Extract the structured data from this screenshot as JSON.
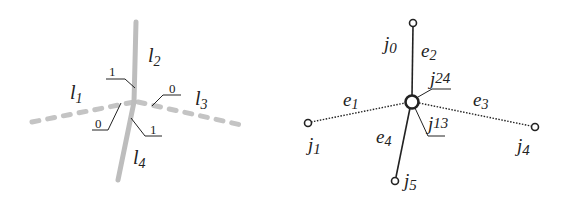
{
  "left_diagram": {
    "lines": [
      {
        "id": "l1",
        "label": "l",
        "sub": "1",
        "style": "dashed"
      },
      {
        "id": "l2",
        "label": "l",
        "sub": "2",
        "style": "solid"
      },
      {
        "id": "l3",
        "label": "l",
        "sub": "3",
        "style": "dashed"
      },
      {
        "id": "l4",
        "label": "l",
        "sub": "4",
        "style": "solid"
      }
    ],
    "annotations": [
      {
        "position": "upper-left",
        "value": "1"
      },
      {
        "position": "upper-right",
        "value": "0"
      },
      {
        "position": "lower-left",
        "value": "0"
      },
      {
        "position": "lower-right",
        "value": "1"
      }
    ],
    "line_color": "#bdbdbd"
  },
  "right_diagram": {
    "nodes": [
      {
        "id": "j0",
        "label": "j",
        "sub": "0"
      },
      {
        "id": "j1",
        "label": "j",
        "sub": "1"
      },
      {
        "id": "j4",
        "label": "j",
        "sub": "4"
      },
      {
        "id": "j5",
        "label": "j",
        "sub": "5"
      },
      {
        "id": "j24",
        "label": "j",
        "sub": "24"
      },
      {
        "id": "j13",
        "label": "j",
        "sub": "13"
      }
    ],
    "edges": [
      {
        "id": "e1",
        "label": "e",
        "sub": "1",
        "style": "dotted",
        "from": "j1",
        "to": "center"
      },
      {
        "id": "e2",
        "label": "e",
        "sub": "2",
        "style": "solid",
        "from": "j0",
        "to": "center"
      },
      {
        "id": "e3",
        "label": "e",
        "sub": "3",
        "style": "dotted",
        "from": "center",
        "to": "j4"
      },
      {
        "id": "e4",
        "label": "e",
        "sub": "4",
        "style": "solid",
        "from": "center",
        "to": "j5"
      }
    ],
    "line_color": "#222222"
  }
}
